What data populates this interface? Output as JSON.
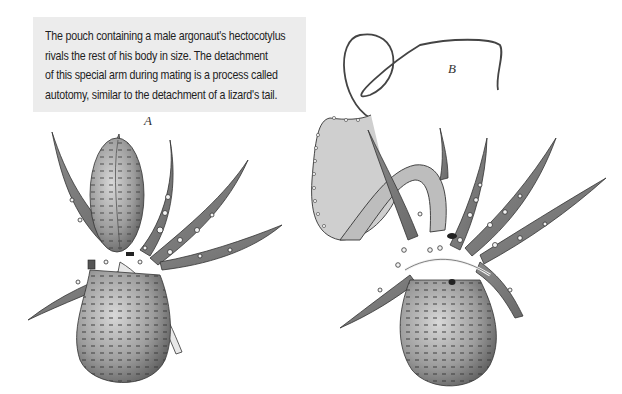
{
  "caption": {
    "lines": [
      "The pouch containing a male argonaut's hectocotylus",
      "rivals the rest of his body in size. The detachment",
      "of this special arm during mating is a process called",
      "autotomy, similar to the detachment of a lizard's tail."
    ]
  },
  "figures": {
    "a": {
      "label": "A",
      "description": "Male argonaut with hectocotylus pouch intact"
    },
    "b": {
      "label": "B",
      "description": "Male argonaut with hectocotylus arm extended"
    }
  },
  "colors": {
    "caption_bg": "#ececec",
    "ink": "#2a2a2a",
    "body_shade": "#9a9a9a"
  }
}
